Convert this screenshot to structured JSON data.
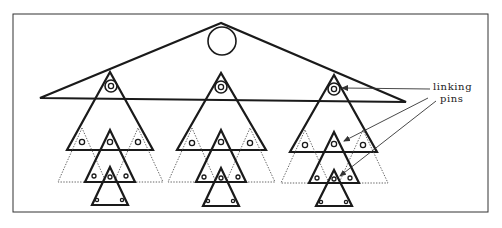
{
  "diagram": {
    "frame": {
      "x": 13,
      "y": 14,
      "w": 475,
      "h": 198
    },
    "top_triangle": {
      "apex": [
        221,
        23
      ],
      "left": [
        40,
        98
      ],
      "right": [
        406,
        102
      ],
      "circle": {
        "cx": 222,
        "cy": 41,
        "r": 14
      }
    },
    "groups": [
      {
        "name": "left",
        "cx": 110,
        "top": 72,
        "base": 150,
        "half": 43
      },
      {
        "name": "center",
        "cx": 221,
        "top": 73,
        "base": 150,
        "half": 44
      },
      {
        "name": "right",
        "cx": 334,
        "top": 75,
        "base": 152,
        "half": 44
      }
    ],
    "annotation": {
      "line1": "linking",
      "line2": "pins"
    },
    "colors": {
      "ink": "#1a1a1a",
      "dotted": "#555555",
      "background": "#ffffff"
    }
  }
}
